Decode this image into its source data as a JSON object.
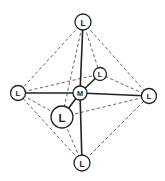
{
  "diagram": {
    "atoms": [
      {
        "id": "top",
        "label": "L",
        "x": 83,
        "y": 22,
        "r": 8
      },
      {
        "id": "left",
        "label": "L",
        "x": 18,
        "y": 93,
        "r": 7.5
      },
      {
        "id": "back",
        "label": "L",
        "x": 100,
        "y": 74,
        "r": 6.5
      },
      {
        "id": "metal",
        "label": "M",
        "x": 80,
        "y": 93,
        "r": 7
      },
      {
        "id": "right",
        "label": "L",
        "x": 149,
        "y": 96,
        "r": 7.5
      },
      {
        "id": "front",
        "label": "L",
        "x": 62,
        "y": 117,
        "r": 11
      },
      {
        "id": "bottom",
        "label": "L",
        "x": 82,
        "y": 163,
        "r": 8
      }
    ],
    "solid_bonds": [
      [
        "metal",
        "top"
      ],
      [
        "metal",
        "bottom"
      ],
      [
        "metal",
        "left"
      ],
      [
        "metal",
        "right"
      ],
      [
        "metal",
        "front"
      ],
      [
        "metal",
        "back"
      ]
    ],
    "dashed_edges": [
      [
        "top",
        "left"
      ],
      [
        "top",
        "right"
      ],
      [
        "top",
        "back"
      ],
      [
        "top",
        "front"
      ],
      [
        "bottom",
        "left"
      ],
      [
        "bottom",
        "right"
      ],
      [
        "bottom",
        "front"
      ],
      [
        "left",
        "back"
      ],
      [
        "left",
        "front"
      ],
      [
        "right",
        "back"
      ],
      [
        "right",
        "front"
      ]
    ]
  }
}
